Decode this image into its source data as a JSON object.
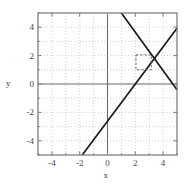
{
  "chart_data": {
    "type": "line",
    "title": "",
    "xlabel": "x",
    "ylabel": "y",
    "xlim": [
      -5,
      5
    ],
    "ylim": [
      -5,
      5
    ],
    "xticks": [
      -4,
      -2,
      0,
      2,
      4
    ],
    "yticks": [
      -4,
      -2,
      0,
      2,
      4
    ],
    "xtick_labels": [
      "-4",
      "-2",
      "0",
      "2",
      "4"
    ],
    "ytick_labels": [
      "-4",
      "-2",
      "0",
      "2",
      "4"
    ],
    "grid": true,
    "grid_style": "dotted",
    "grid_color": "#bdbdbd",
    "axis_color": "#6b6b6b",
    "frame_color": "#7a7a7a",
    "legend": null,
    "series": [
      {
        "name": "line-positive-slope",
        "type": "line",
        "color": "#1a1a1a",
        "style": "solid",
        "slope": 1.31,
        "intercept": -2.62,
        "points": [
          [
            -2.0,
            -5.0
          ],
          [
            0.0,
            -2.62
          ],
          [
            2.0,
            0.0
          ],
          [
            5.0,
            3.93
          ]
        ]
      },
      {
        "name": "line-negative-slope",
        "type": "line",
        "color": "#1a1a1a",
        "style": "solid",
        "slope": -1.35,
        "intercept": 6.35,
        "points": [
          [
            1.0,
            5.0
          ],
          [
            2.0,
            3.65
          ],
          [
            4.7,
            0.0
          ],
          [
            5.0,
            -0.4
          ]
        ]
      }
    ],
    "annotations": [
      {
        "name": "zoom-box",
        "type": "rect",
        "style": "dashed",
        "color": "#555555",
        "x0": 2.05,
        "y0": 1.0,
        "x1": 3.15,
        "y1": 2.05
      }
    ],
    "intersection": [
      2.82,
      1.08
    ]
  }
}
